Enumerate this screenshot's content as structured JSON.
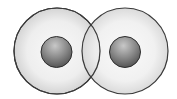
{
  "diagram": {
    "type": "overlapping-atoms",
    "background": "#ffffff",
    "atoms": [
      {
        "id": "left",
        "shell": {
          "cx": 57,
          "cy": 51,
          "r": 43
        },
        "nucleus": {
          "cx": 56.5,
          "cy": 52,
          "r": 15.5
        }
      },
      {
        "id": "right",
        "shell": {
          "cx": 125,
          "cy": 51,
          "r": 43
        },
        "nucleus": {
          "cx": 125,
          "cy": 52,
          "r": 15.5
        }
      }
    ],
    "colors": {
      "shell_fill_center": "#f8f8f8",
      "shell_fill_edge": "#d6d6d6",
      "shell_stroke": "#3a3a3a",
      "nucleus_light": "#c4c4c4",
      "nucleus_dark": "#5e5e5e",
      "nucleus_stroke": "#2e2e2e"
    }
  }
}
